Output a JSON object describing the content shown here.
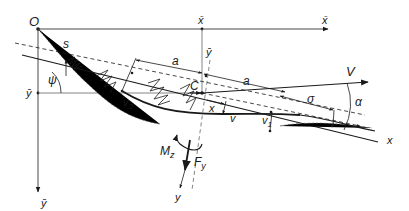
{
  "diagram": {
    "labels": {
      "origin": "O",
      "x_bar_top": "x̄",
      "x_bar_right": "x̄",
      "y_bar_left": "ȳ",
      "y_bar_bottom": "ȳ",
      "y_bar_local": "ȳ",
      "s": "s",
      "psi": "ψ",
      "a_left": "a",
      "a_right": "a",
      "C": "C",
      "V": "V",
      "sigma": "σ",
      "alpha": "α",
      "x_local": "x",
      "x_axis": "x",
      "v": "v",
      "v1": "v",
      "v1_sub": "1",
      "v2": "v",
      "v2_sub": "2",
      "Mz": "M",
      "Mz_sub": "z",
      "Fy": "F",
      "Fy_sub": "y",
      "y_axis": "y"
    },
    "colors": {
      "line": "#1a1a1a",
      "dashed": "#555555",
      "background": "#ffffff"
    }
  }
}
